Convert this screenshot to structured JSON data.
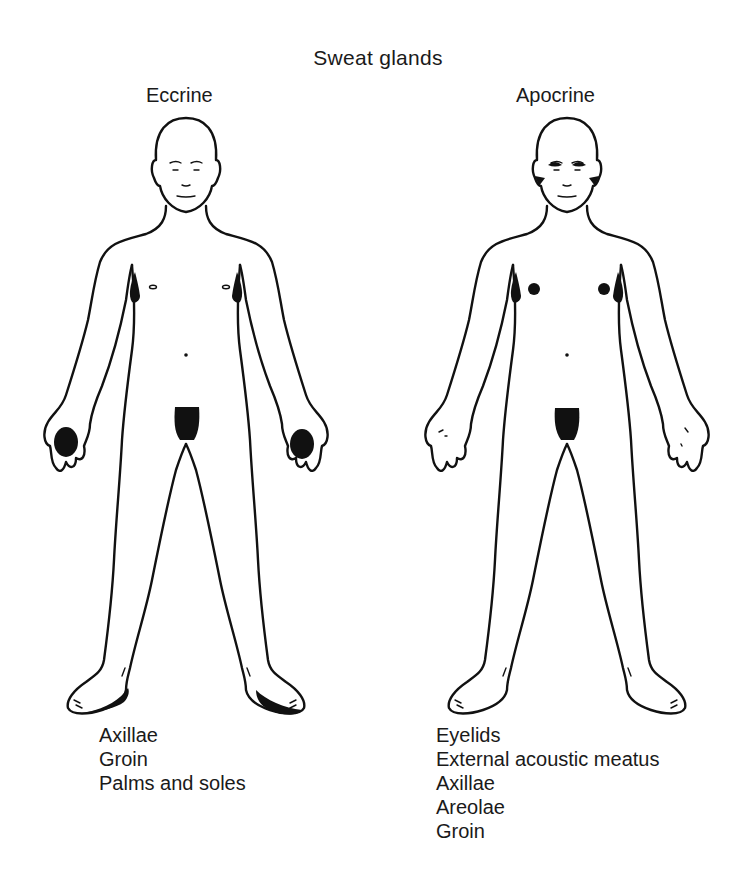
{
  "title": "Sweat glands",
  "figures": [
    {
      "key": "eccrine",
      "label": "Eccrine",
      "locations": [
        "Axillae",
        "Groin",
        "Palms and soles"
      ]
    },
    {
      "key": "apocrine",
      "label": "Apocrine",
      "locations": [
        "Eyelids",
        "External acoustic meatus",
        "Axillae",
        "Areolae",
        "Groin"
      ]
    }
  ],
  "colors": {
    "line": "#111111",
    "gland_fill": "#111111",
    "background": "#ffffff"
  }
}
